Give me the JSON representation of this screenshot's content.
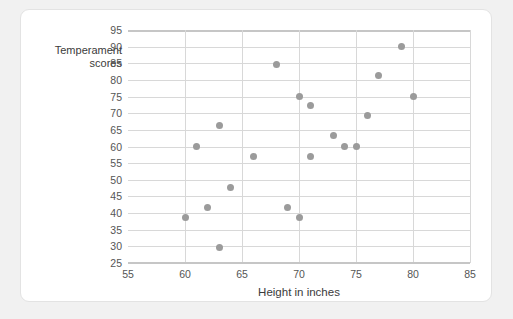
{
  "chart_data": {
    "type": "scatter",
    "title": "",
    "xlabel": "Height in inches",
    "ylabel": "Temperament scores",
    "ylabel_lines": [
      "Temperament",
      "scores"
    ],
    "xlim": [
      55,
      85
    ],
    "ylim": [
      25,
      95
    ],
    "xticks": [
      55,
      60,
      65,
      70,
      75,
      80,
      85
    ],
    "yticks": [
      25,
      30,
      35,
      40,
      45,
      50,
      55,
      60,
      65,
      70,
      75,
      80,
      85,
      90,
      95
    ],
    "grid": true,
    "grid_axis": "both",
    "legend": null,
    "point_color": "#9b9b9b",
    "grid_color": "#d8d8d8",
    "axis_color": "#c6c6c6",
    "points": [
      {
        "x": 60,
        "y": 38.7
      },
      {
        "x": 61,
        "y": 60.0
      },
      {
        "x": 62,
        "y": 41.7
      },
      {
        "x": 63,
        "y": 66.2
      },
      {
        "x": 63,
        "y": 29.7
      },
      {
        "x": 64,
        "y": 47.8
      },
      {
        "x": 66,
        "y": 57.0
      },
      {
        "x": 68,
        "y": 84.5
      },
      {
        "x": 69,
        "y": 41.7
      },
      {
        "x": 70,
        "y": 38.7
      },
      {
        "x": 70,
        "y": 75.0
      },
      {
        "x": 71,
        "y": 72.3
      },
      {
        "x": 71,
        "y": 57.0
      },
      {
        "x": 73,
        "y": 63.2
      },
      {
        "x": 74,
        "y": 60.0
      },
      {
        "x": 75,
        "y": 60.0
      },
      {
        "x": 76,
        "y": 69.3
      },
      {
        "x": 77,
        "y": 81.4
      },
      {
        "x": 79,
        "y": 90.0
      },
      {
        "x": 80,
        "y": 75.0
      }
    ]
  }
}
